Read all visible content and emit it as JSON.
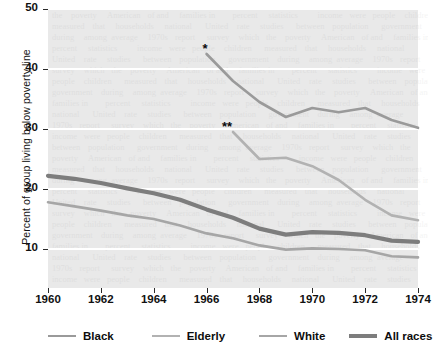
{
  "chart_data": {
    "type": "line",
    "title": "",
    "xlabel": "",
    "ylabel": "Percent of group living below poverty line",
    "xlim": [
      1960,
      1974
    ],
    "ylim": [
      5,
      50
    ],
    "yticks": [
      10,
      20,
      30,
      40,
      50
    ],
    "ytick_labels": [
      "10",
      "20",
      "30",
      "40",
      "50"
    ],
    "xticks": [
      1960,
      1962,
      1964,
      1966,
      1968,
      1970,
      1972,
      1974
    ],
    "xtick_labels": [
      "1960",
      "1962",
      "1964",
      "1966",
      "1968",
      "1970",
      "1972",
      "1974"
    ],
    "grid": "horizontal-white-gridlines",
    "legend_position": "below-axis",
    "plot_background": "#e9e9e9",
    "gridline_color": "#ffffff",
    "series": [
      {
        "name": "Black",
        "color": "#9a9a9a",
        "width": 2.6,
        "marker_note": "*",
        "x": [
          1966,
          1967,
          1968,
          1969,
          1970,
          1971,
          1972,
          1973,
          1974
        ],
        "values": [
          42.5,
          38.0,
          34.5,
          32.0,
          33.5,
          32.8,
          33.5,
          31.5,
          30.2
        ]
      },
      {
        "name": "Elderly",
        "color": "#b2b2b2",
        "width": 2.6,
        "marker_note": "**",
        "x": [
          1967,
          1968,
          1969,
          1970,
          1971,
          1972,
          1973,
          1974
        ],
        "values": [
          29.5,
          25.0,
          25.2,
          23.8,
          21.5,
          18.2,
          15.6,
          14.8
        ]
      },
      {
        "name": "White",
        "color": "#a6a6a6",
        "width": 2.6,
        "x": [
          1960,
          1961,
          1962,
          1963,
          1964,
          1965,
          1966,
          1967,
          1968,
          1969,
          1970,
          1971,
          1972,
          1973,
          1974
        ],
        "values": [
          17.8,
          17.1,
          16.4,
          15.6,
          15.0,
          13.9,
          12.6,
          11.8,
          10.6,
          9.9,
          10.1,
          10.0,
          9.8,
          8.8,
          8.6
        ]
      },
      {
        "name": "All races",
        "color": "#7d7d7d",
        "width": 4.2,
        "x": [
          1960,
          1961,
          1962,
          1963,
          1964,
          1965,
          1966,
          1967,
          1968,
          1969,
          1970,
          1971,
          1972,
          1973,
          1974
        ],
        "values": [
          22.2,
          21.7,
          21.0,
          20.1,
          19.3,
          18.2,
          16.6,
          15.2,
          13.4,
          12.4,
          12.8,
          12.7,
          12.3,
          11.4,
          11.2
        ]
      }
    ],
    "annotations": [
      {
        "text": "*",
        "series": "Black",
        "x": 1966,
        "y": 42.5
      },
      {
        "text": "**",
        "series": "Elderly",
        "x": 1967,
        "y": 29.5
      }
    ]
  }
}
